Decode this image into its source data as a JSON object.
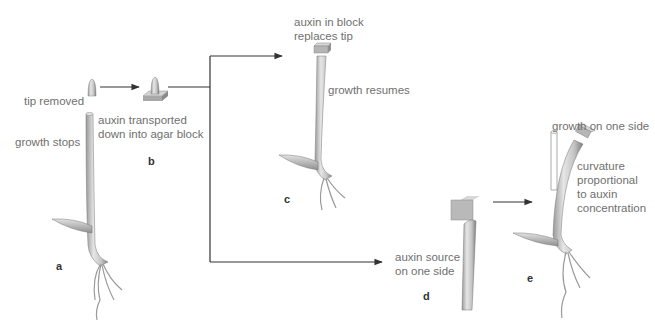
{
  "figure": {
    "panels": [
      {
        "id": "a",
        "label": "a",
        "captions": [
          "tip removed",
          "growth stops"
        ]
      },
      {
        "id": "b",
        "label": "b",
        "captions": [
          "auxin transported",
          "down into agar block"
        ]
      },
      {
        "id": "c",
        "label": "c",
        "captions": [
          "auxin in block",
          "replaces tip",
          "growth resumes"
        ]
      },
      {
        "id": "d",
        "label": "d",
        "captions": [
          "auxin source",
          "on one side"
        ]
      },
      {
        "id": "e",
        "label": "e",
        "captions": [
          "growth on one side",
          "curvature",
          "proportional",
          "to auxin",
          "concentration"
        ]
      }
    ],
    "colors": {
      "stem": "#c9c9c9",
      "stem_shade": "#8c8c8c",
      "block": "#b8b8b8",
      "arrow": "#333333",
      "text": "#6f6f6f"
    }
  }
}
